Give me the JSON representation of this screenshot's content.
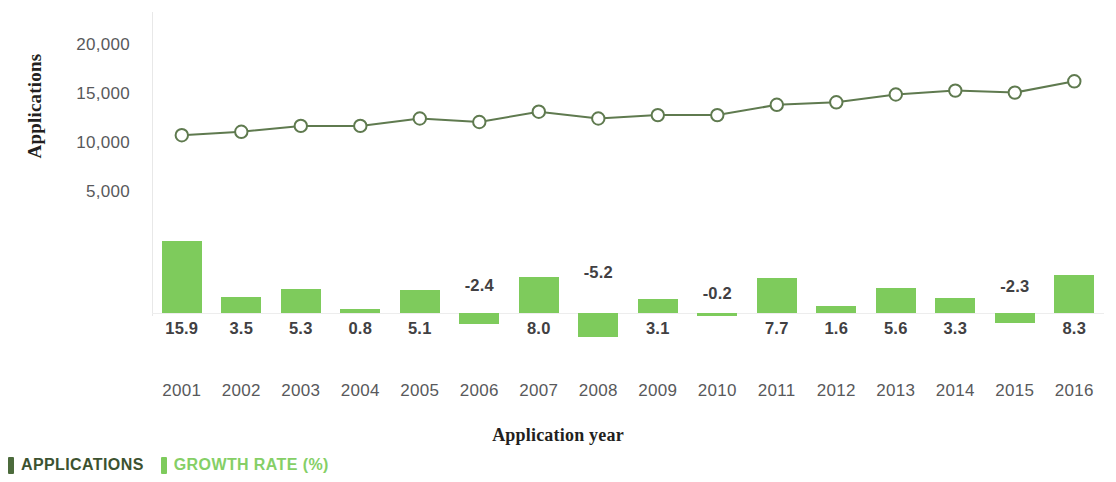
{
  "chart_data": {
    "type": "bar",
    "title": "",
    "xlabel": "Application year",
    "ylabel": "Applications",
    "categories": [
      "2001",
      "2002",
      "2003",
      "2004",
      "2005",
      "2006",
      "2007",
      "2008",
      "2009",
      "2010",
      "2011",
      "2012",
      "2013",
      "2014",
      "2015",
      "2016"
    ],
    "ylim": [
      0,
      21000
    ],
    "yticks": [
      "5,000",
      "10,000",
      "15,000",
      "20,000"
    ],
    "ytick_values": [
      5000,
      10000,
      15000,
      20000
    ],
    "grid": false,
    "legend_position": "bottom-left",
    "series": [
      {
        "name": "APPLICATIONS",
        "type": "line",
        "marker": "open-circle",
        "color": "#5f7a4f",
        "values": [
          10900,
          11250,
          11850,
          11850,
          12600,
          12250,
          13300,
          12600,
          12950,
          12950,
          14000,
          14250,
          15050,
          15450,
          15250,
          16400
        ]
      },
      {
        "name": "GROWTH RATE (%)",
        "type": "bar",
        "color": "#7ecb5c",
        "values": [
          15.9,
          3.5,
          5.3,
          0.8,
          5.1,
          -2.4,
          8.0,
          -5.2,
          3.1,
          -0.2,
          7.7,
          1.6,
          5.6,
          3.3,
          -2.3,
          8.3
        ],
        "labels": [
          "15.9",
          "3.5",
          "5.3",
          "0.8",
          "5.1",
          "-2.4",
          "8.0",
          "-5.2",
          "3.1",
          "-0.2",
          "7.7",
          "1.6",
          "5.6",
          "3.3",
          "-2.3",
          "8.3"
        ]
      }
    ]
  },
  "legend": {
    "items": [
      {
        "label": "APPLICATIONS",
        "color": "#4c6b3c",
        "text_color": "#3c5230"
      },
      {
        "label": "GROWTH RATE (%)",
        "color": "#7ecb5c",
        "text_color": "#85cf66"
      }
    ]
  },
  "colors": {
    "bar": "#7ecb5c",
    "line": "#5f7a4f",
    "tick_text": "#58595b",
    "label_text": "#414042",
    "axis_title": "#231f20"
  }
}
